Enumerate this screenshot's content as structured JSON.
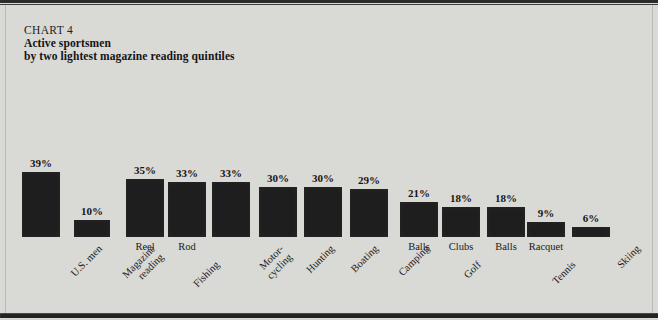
{
  "header": {
    "chart_number": "CHART 4",
    "title_line_1": "Active sportsmen",
    "title_line_2": "by two lightest magazine reading quintiles"
  },
  "colors": {
    "background": "#d9d9d5",
    "bar": "#1e1e1e",
    "text": "#151515",
    "frame_rule": "#232323"
  },
  "chart_data": {
    "type": "bar",
    "title": "Active sportsmen by two lightest magazine reading quintiles",
    "subtitle": "CHART 4",
    "xlabel": "",
    "ylabel": "",
    "ylim": [
      0,
      39
    ],
    "grid": false,
    "legend": "none",
    "value_suffix": "%",
    "categories": [
      "U.S. men",
      "Magazine reading",
      "Fishing - Reel",
      "Fishing - Rod",
      "Motor-cycling",
      "Hunting",
      "Boating",
      "Camping",
      "Golf - Balls",
      "Golf - Clubs",
      "Tennis - Balls",
      "Tennis - Racquet",
      "Skiing"
    ],
    "values": [
      39,
      10,
      35,
      33,
      33,
      30,
      30,
      29,
      21,
      18,
      18,
      9,
      6
    ],
    "value_labels": [
      "39%",
      "10%",
      "35%",
      "33%",
      "33%",
      "30%",
      "30%",
      "29%",
      "21%",
      "18%",
      "18%",
      "9%",
      "6%"
    ],
    "bars": [
      {
        "value_label": "39%",
        "value": 39,
        "sublabel": "",
        "group_label": "U.S. men"
      },
      {
        "value_label": "10%",
        "value": 10,
        "sublabel": "",
        "group_label": "Magazine\nreading"
      },
      {
        "value_label": "35%",
        "value": 35,
        "sublabel": "Reel",
        "group_label": ""
      },
      {
        "value_label": "33%",
        "value": 33,
        "sublabel": "Rod",
        "group_label": "Fishing"
      },
      {
        "value_label": "33%",
        "value": 33,
        "sublabel": "",
        "group_label": "Motor-\ncycling"
      },
      {
        "value_label": "30%",
        "value": 30,
        "sublabel": "",
        "group_label": "Hunting"
      },
      {
        "value_label": "30%",
        "value": 30,
        "sublabel": "",
        "group_label": "Boating"
      },
      {
        "value_label": "29%",
        "value": 29,
        "sublabel": "",
        "group_label": "Camping"
      },
      {
        "value_label": "21%",
        "value": 21,
        "sublabel": "Balls",
        "group_label": ""
      },
      {
        "value_label": "18%",
        "value": 18,
        "sublabel": "Clubs",
        "group_label": "Golf"
      },
      {
        "value_label": "18%",
        "value": 18,
        "sublabel": "Balls",
        "group_label": ""
      },
      {
        "value_label": "9%",
        "value": 9,
        "sublabel": "Racquet",
        "group_label": "Tennis"
      },
      {
        "value_label": "6%",
        "value": 6,
        "sublabel": "",
        "group_label": "Skiing"
      }
    ],
    "groups": [
      {
        "label": "U.S. men",
        "bars": [
          0
        ]
      },
      {
        "label": "Magazine reading",
        "bars": [
          1
        ]
      },
      {
        "label": "Fishing",
        "bars": [
          2,
          3
        ]
      },
      {
        "label": "Motor-cycling",
        "bars": [
          4
        ]
      },
      {
        "label": "Hunting",
        "bars": [
          5
        ]
      },
      {
        "label": "Boating",
        "bars": [
          6
        ]
      },
      {
        "label": "Camping",
        "bars": [
          7
        ]
      },
      {
        "label": "Golf",
        "bars": [
          8,
          9
        ]
      },
      {
        "label": "Tennis",
        "bars": [
          10,
          11
        ]
      },
      {
        "label": "Skiing",
        "bars": [
          12
        ]
      }
    ]
  },
  "layout": {
    "baseline_y": 237,
    "px_per_unit": 1.668,
    "bar_x": [
      22,
      74,
      126,
      168,
      212,
      259,
      304,
      350,
      400,
      442,
      487,
      527,
      572
    ],
    "bar_w": [
      38,
      36,
      38,
      38,
      38,
      38,
      38,
      38,
      38,
      38,
      38,
      38,
      38
    ]
  }
}
